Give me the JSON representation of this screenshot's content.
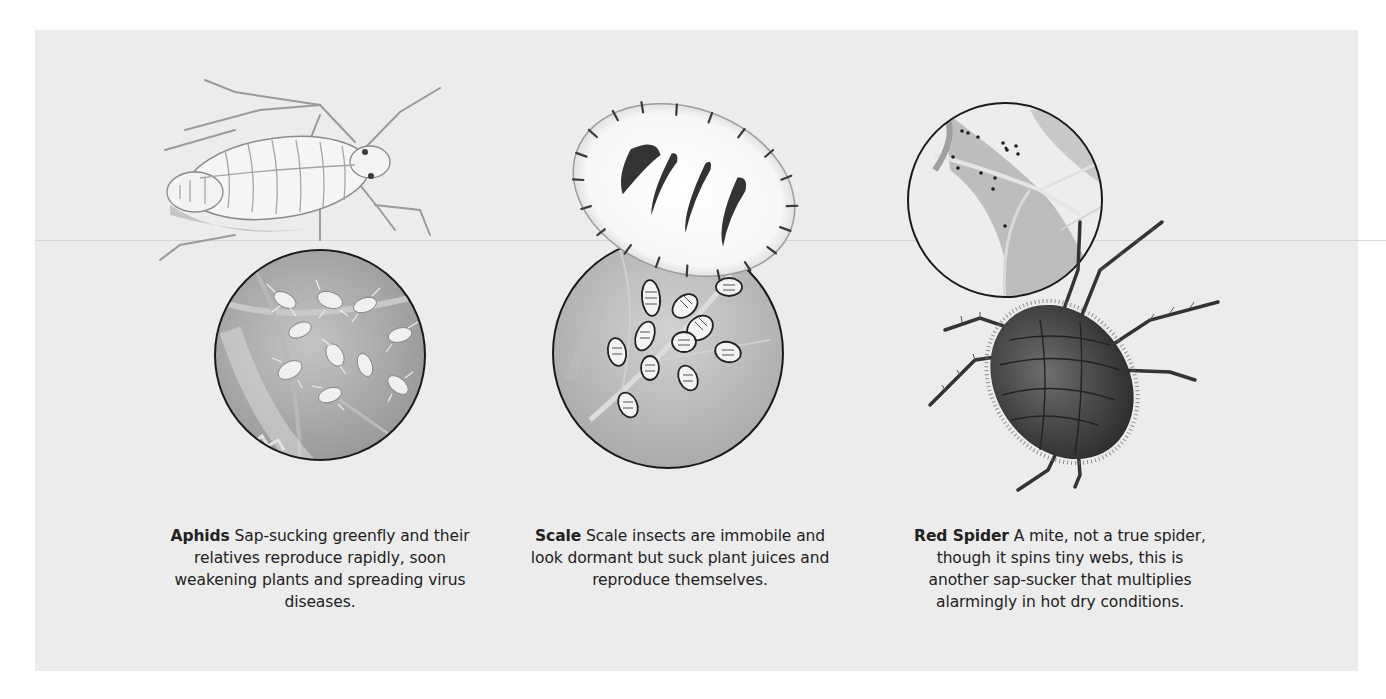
{
  "figures": [
    {
      "id": "aphids",
      "name": "Aphids",
      "description": "Sap-sucking greenfly and their relatives reproduce rapidly, soon weakening plants and spreading virus diseases."
    },
    {
      "id": "scale",
      "name": "Scale",
      "description": "Scale insects are immobile and look dormant but suck plant juices and reproduce themselves."
    },
    {
      "id": "red-spider",
      "name": "Red Spider",
      "description": "A mite, not a true spider, though it spins tiny webs, this is another sap-sucker that multiplies alarmingly in hot dry conditions."
    }
  ],
  "colors": {
    "panel": "#ececec",
    "ink": "#222222",
    "leaf": "#a9a9a9",
    "mite": "#4a4a4a"
  }
}
